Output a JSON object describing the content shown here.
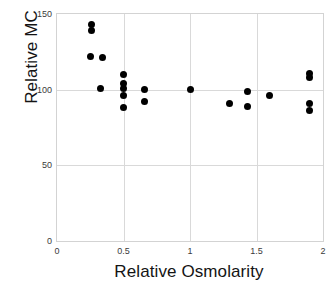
{
  "chart_data": {
    "type": "scatter",
    "title": "",
    "xlabel": "Relative Osmolarity",
    "ylabel": "Relative MC",
    "xlim": [
      0,
      2
    ],
    "ylim": [
      0,
      150
    ],
    "xticks": [
      "0",
      "0.5",
      "1",
      "1.5",
      "2"
    ],
    "xtick_values": [
      0,
      0.5,
      1,
      1.5,
      2
    ],
    "yticks": [
      "0",
      "50",
      "100",
      "150"
    ],
    "ytick_values": [
      0,
      50,
      100,
      150
    ],
    "grid": true,
    "legend": "none",
    "marker": "filled-circle",
    "marker_color": "#000000",
    "series": [
      {
        "name": "Relative MC vs Relative Osmolarity",
        "points": [
          {
            "x": 0.26,
            "y": 143
          },
          {
            "x": 0.26,
            "y": 139
          },
          {
            "x": 0.25,
            "y": 122
          },
          {
            "x": 0.34,
            "y": 121
          },
          {
            "x": 0.33,
            "y": 101
          },
          {
            "x": 0.5,
            "y": 110
          },
          {
            "x": 0.5,
            "y": 104
          },
          {
            "x": 0.5,
            "y": 101
          },
          {
            "x": 0.5,
            "y": 96
          },
          {
            "x": 0.5,
            "y": 88
          },
          {
            "x": 0.66,
            "y": 100
          },
          {
            "x": 0.66,
            "y": 92
          },
          {
            "x": 1.0,
            "y": 100
          },
          {
            "x": 1.3,
            "y": 91
          },
          {
            "x": 1.43,
            "y": 99
          },
          {
            "x": 1.43,
            "y": 89
          },
          {
            "x": 1.6,
            "y": 96
          },
          {
            "x": 1.9,
            "y": 111
          },
          {
            "x": 1.9,
            "y": 108
          },
          {
            "x": 1.9,
            "y": 91
          },
          {
            "x": 1.9,
            "y": 86
          }
        ]
      }
    ]
  }
}
